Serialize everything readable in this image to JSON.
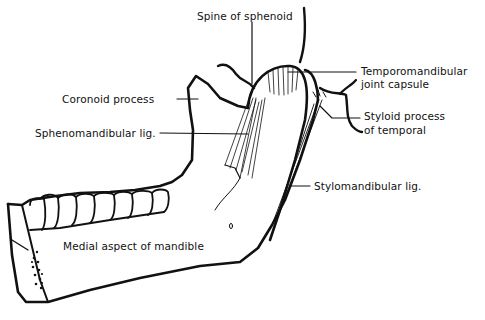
{
  "diagram": {
    "title": "Medial aspect of mandible",
    "labels": {
      "spine_of_sphenoid": "Spine of sphenoid",
      "tmj_capsule_line1": "Temporomandibular",
      "tmj_capsule_line2": "joint capsule",
      "coronoid_process": "Coronoid process",
      "sphenomandibular_lig": "Sphenomandibular lig.",
      "styloid_line1": "Styloid process",
      "styloid_line2": "of temporal",
      "stylomandibular_lig": "Stylomandibular lig.",
      "medial_aspect": "Medial aspect of mandible"
    },
    "colors": {
      "ink": "#111111",
      "background": "#ffffff"
    }
  }
}
